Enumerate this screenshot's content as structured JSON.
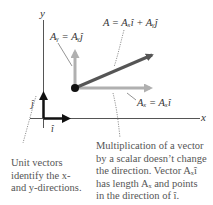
{
  "diagram": {
    "axes": {
      "x_label": "x",
      "y_label": "y"
    },
    "vectors": {
      "A": {
        "label": "A = Aₓî + Aᵧĵ",
        "color": "#555555"
      },
      "Ay": {
        "label": "Aᵧ = Aᵧĵ",
        "color": "#b0b0b0"
      },
      "Ax": {
        "label": "Aₓ = Aₓî",
        "color": "#b0b0b0"
      },
      "i_hat": {
        "label": "î",
        "color": "#111111"
      },
      "j_hat": {
        "label": "ĵ",
        "color": "#111111"
      }
    },
    "captions": {
      "unit_vectors": [
        "Unit vectors",
        "identify the x-",
        "and y-directions."
      ],
      "multiplication": [
        "Multiplication of a vector",
        "by a scalar doesn’t change",
        "the direction. Vector Aₓî",
        "has length Aₓ and points",
        "in the direction of î."
      ]
    }
  }
}
